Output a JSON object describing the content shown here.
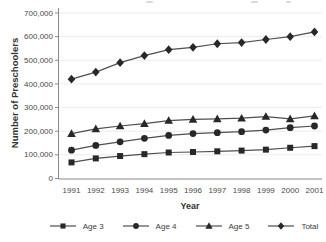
{
  "chart_data": {
    "type": "line",
    "title": "",
    "xlabel": "Year",
    "ylabel": "Number of Preschoolers",
    "x": [
      1991,
      1992,
      1993,
      1994,
      1995,
      1996,
      1997,
      1998,
      1999,
      2000,
      2001
    ],
    "series": [
      {
        "name": "Age 3",
        "marker": "square",
        "values": [
          68000,
          85000,
          95000,
          103000,
          110000,
          112000,
          115000,
          118000,
          122000,
          130000,
          137000
        ]
      },
      {
        "name": "Age 4",
        "marker": "circle",
        "values": [
          120000,
          140000,
          155000,
          170000,
          182000,
          190000,
          194000,
          198000,
          205000,
          215000,
          222000
        ]
      },
      {
        "name": "Age 5",
        "marker": "triangle",
        "values": [
          190000,
          210000,
          222000,
          232000,
          245000,
          250000,
          252000,
          255000,
          262000,
          252000,
          265000
        ]
      },
      {
        "name": "Total",
        "marker": "diamond",
        "values": [
          420000,
          450000,
          490000,
          520000,
          545000,
          555000,
          570000,
          575000,
          588000,
          600000,
          620000
        ]
      }
    ],
    "ylim": [
      0,
      700000
    ],
    "ytick_step": 100000,
    "ytick_labels": [
      "0",
      "100,000",
      "200,000",
      "300,000",
      "400,000",
      "500,000",
      "600,000",
      "700,000"
    ],
    "grid": true,
    "legend_position": "bottom",
    "colors": {
      "line": "#4f4f4f",
      "marker": "#282828",
      "grid": "#ececec",
      "axis": "#8a8a8a",
      "tick_text": "#4a4a4a"
    }
  }
}
